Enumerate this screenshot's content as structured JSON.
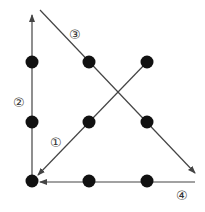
{
  "dots": [
    {
      "x": 32,
      "y": 62
    },
    {
      "x": 89,
      "y": 62
    },
    {
      "x": 147,
      "y": 62
    },
    {
      "x": 32,
      "y": 122
    },
    {
      "x": 89,
      "y": 122
    },
    {
      "x": 147,
      "y": 122
    },
    {
      "x": 32,
      "y": 181
    },
    {
      "x": 89,
      "y": 181
    },
    {
      "x": 147,
      "y": 181
    }
  ],
  "strokes": [
    {
      "step": "①",
      "from": [
        147,
        62
      ],
      "to": [
        38,
        175
      ],
      "label_pos": [
        57,
        142
      ]
    },
    {
      "step": "②",
      "from": [
        32,
        175
      ],
      "to": [
        32,
        15
      ],
      "label_pos": [
        20,
        102
      ]
    },
    {
      "step": "③",
      "from": [
        40,
        10
      ],
      "to": [
        195,
        173
      ],
      "label_pos": [
        76,
        34
      ]
    },
    {
      "step": "④",
      "from": [
        195,
        182
      ],
      "to": [
        40,
        182
      ],
      "label_pos": [
        183,
        199
      ]
    }
  ],
  "labels": {
    "s1": "①",
    "s2": "②",
    "s3": "③",
    "s4": "④"
  },
  "colors": {
    "dot": "#111111",
    "line": "#444444"
  }
}
